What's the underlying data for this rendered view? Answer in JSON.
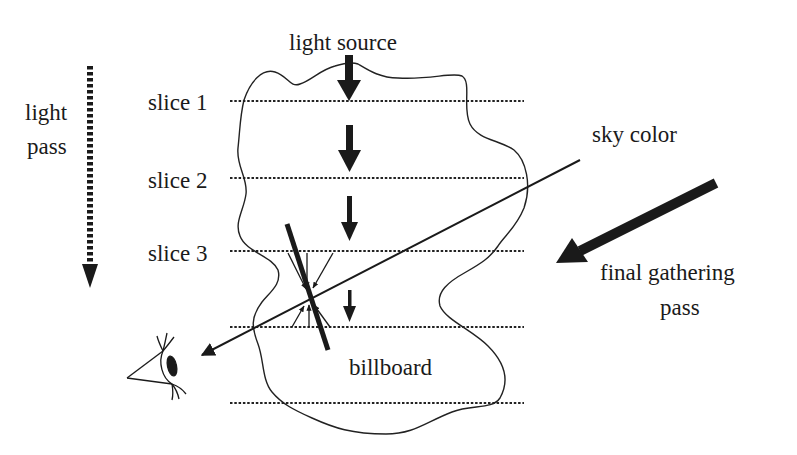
{
  "diagram": {
    "title": "",
    "labels": {
      "light_source": "light source",
      "light_pass_line1": "light",
      "light_pass_line2": "pass",
      "slice1": "slice 1",
      "slice2": "slice 2",
      "slice3": "slice 3",
      "sky_color": "sky color",
      "final_gathering_line1": "final gathering",
      "final_gathering_line2": "pass",
      "billboard": "billboard"
    },
    "elements": [
      {
        "id": "cloud-outline",
        "type": "irregular closed curve"
      },
      {
        "id": "slice-planes",
        "type": "dotted horizontal lines",
        "count": 5
      },
      {
        "id": "light-pass-arrow",
        "type": "dotted downward arrow"
      },
      {
        "id": "light-arrows",
        "type": "downward arrows of decreasing size",
        "count": 4
      },
      {
        "id": "view-ray",
        "type": "line from sky color to eye"
      },
      {
        "id": "final-gathering-arrow",
        "type": "thick diagonal arrow"
      },
      {
        "id": "billboard",
        "type": "thick tilted line segment with converging small arrows"
      },
      {
        "id": "eye",
        "type": "eye glyph"
      }
    ],
    "colors": {
      "ink": "#1a1a1a",
      "background": "#ffffff"
    }
  }
}
